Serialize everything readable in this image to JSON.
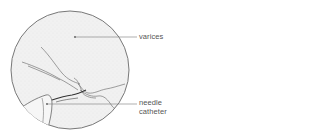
{
  "figure": {
    "labels": [
      {
        "id": "varices",
        "text": "varices"
      },
      {
        "id": "needle-catheter",
        "lines": [
          "needle",
          "catheter"
        ]
      }
    ]
  },
  "colors": {
    "outline": "#6a6a6a",
    "fill": "#ececec",
    "leader": "#7a7a7a",
    "text": "#555555"
  }
}
